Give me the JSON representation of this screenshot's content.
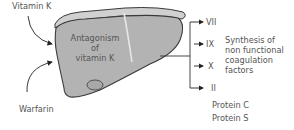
{
  "inputs": {
    "vitamin_k": "Vitamin K",
    "warfarin": "Warfarin"
  },
  "liver": {
    "line1": "Antagonism",
    "line2": "of",
    "line3": "vitamin K"
  },
  "factors": [
    "VII",
    "IX",
    "X",
    "II"
  ],
  "synthesis": {
    "line1": "Synthesis of",
    "line2": "non functional",
    "line3": "coagulation",
    "line4": "factors"
  },
  "proteins": [
    "Protein C",
    "Protein S"
  ],
  "colors": {
    "liver_fill": "#b3b3b3",
    "liver_top_fill": "#d0d0d0",
    "outline": "#3a3a3a",
    "text": "#555555"
  }
}
